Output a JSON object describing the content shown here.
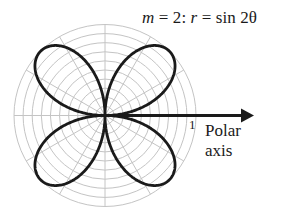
{
  "title": {
    "m_symbol": "m",
    "m_eq": " = 2:  ",
    "r_symbol": "r",
    "r_eq": " = sin 2θ"
  },
  "axis": {
    "label_line1": "Polar",
    "label_line2": "axis",
    "tick_label": "1"
  },
  "colors": {
    "curve": "#1a1a1a",
    "grid": "#c4c4c4",
    "axis": "#1a1a1a"
  },
  "chart_data": {
    "type": "polar-line",
    "title": "m = 2: r = sin 2θ",
    "equation": "r = sin(2θ)",
    "m": 2,
    "petals": 4,
    "r_range": [
      0,
      1
    ],
    "grid": {
      "rings": [
        0.1,
        0.2,
        0.3,
        0.4,
        0.5,
        0.6,
        0.7,
        0.8,
        0.9,
        1.0
      ],
      "spoke_angles_deg": [
        0,
        30,
        60,
        90,
        120,
        150,
        180,
        210,
        240,
        270,
        300,
        330
      ]
    },
    "polar_axis_label": "Polar axis",
    "tick_labels": [
      "1"
    ]
  }
}
